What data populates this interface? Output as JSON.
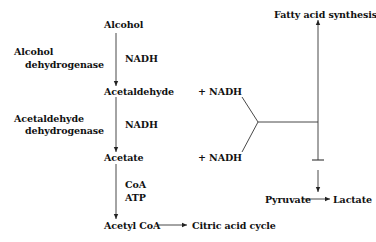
{
  "diagram": {
    "type": "metabolic-pathway",
    "nodes": {
      "alcohol": "Alcohol",
      "acetaldehyde": "Acetaldehyde",
      "acetate": "Acetate",
      "acetyl_coa": "Acetyl CoA",
      "citric_acid_cycle": "Citric acid cycle",
      "fatty_acid_synthesis": "Fatty acid synthesis",
      "pyruvate": "Pyruvate",
      "lactate": "Lactate"
    },
    "enzymes": {
      "alcohol_dh_line1": "Alcohol",
      "alcohol_dh_line2": "dehydrogenase",
      "acetaldehyde_dh_line1": "Acetaldehyde",
      "acetaldehyde_dh_line2": "dehydrogenase"
    },
    "cofactors": {
      "step1": "NADH",
      "step2": "NADH",
      "step3_line1": "CoA",
      "step3_line2": "ATP",
      "plus_nadh_1": "+ NADH",
      "plus_nadh_2": "+ NADH"
    },
    "edges": [
      {
        "from": "Alcohol",
        "to": "Acetaldehyde",
        "type": "arrow"
      },
      {
        "from": "Acetaldehyde",
        "to": "Acetate",
        "type": "arrow"
      },
      {
        "from": "Acetate",
        "to": "Acetyl CoA",
        "type": "arrow"
      },
      {
        "from": "Acetyl CoA",
        "to": "Citric acid cycle",
        "type": "arrow"
      },
      {
        "from": "NADH (combined)",
        "to": "Fatty acid synthesis",
        "type": "arrow"
      },
      {
        "from": "NADH (combined)",
        "to": "Pyruvate",
        "type": "inhibition-then-arrow"
      },
      {
        "from": "Pyruvate",
        "to": "Lactate",
        "type": "arrow"
      }
    ]
  }
}
